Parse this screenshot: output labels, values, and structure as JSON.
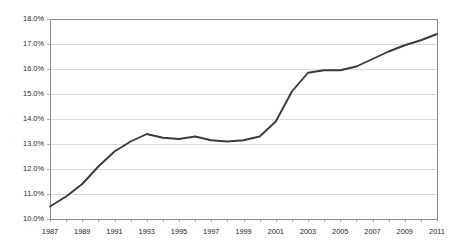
{
  "chart_data": {
    "type": "line",
    "title": "",
    "subtitle": "",
    "xlabel": "",
    "ylabel": "",
    "grid": true,
    "legend": false,
    "legend_position": "none",
    "line_color": "#3a3a3a",
    "gridline_color": "#c9c9c9",
    "axis_color": "#8a8a8a",
    "background_color": "#ffffff",
    "x": [
      1987,
      1988,
      1989,
      1990,
      1991,
      1992,
      1993,
      1994,
      1995,
      1996,
      1997,
      1998,
      1999,
      2000,
      2001,
      2002,
      2003,
      2004,
      2005,
      2006,
      2007,
      2008,
      2009,
      2010,
      2011
    ],
    "values": [
      10.5,
      10.9,
      11.4,
      12.1,
      12.7,
      13.1,
      13.4,
      13.25,
      13.2,
      13.3,
      13.15,
      13.1,
      13.15,
      13.3,
      13.9,
      15.1,
      15.85,
      15.95,
      15.95,
      16.1,
      16.4,
      16.7,
      16.95,
      17.15,
      17.4
    ],
    "xlim": [
      1987,
      2011
    ],
    "ylim": [
      10.0,
      18.0
    ],
    "ytick_values": [
      10.0,
      11.0,
      12.0,
      13.0,
      14.0,
      15.0,
      16.0,
      17.0,
      18.0
    ],
    "ytick_labels": [
      "10.0%",
      "11.0%",
      "12.0%",
      "13.0%",
      "14.0%",
      "15.0%",
      "16.0%",
      "17.0%",
      "18.0%"
    ],
    "xtick_values": [
      1987,
      1989,
      1991,
      1993,
      1995,
      1997,
      1999,
      2001,
      2003,
      2005,
      2007,
      2009,
      2011
    ],
    "xtick_labels": [
      "1987",
      "1989",
      "1991",
      "1993",
      "1995",
      "1997",
      "1999",
      "2001",
      "2003",
      "2005",
      "2007",
      "2009",
      "2011"
    ],
    "xminor_values": [
      1988,
      1990,
      1992,
      1994,
      1996,
      1998,
      2000,
      2002,
      2004,
      2006,
      2008,
      2010
    ],
    "series": [
      {
        "name": "series-1",
        "values": [
          10.5,
          10.9,
          11.4,
          12.1,
          12.7,
          13.1,
          13.4,
          13.25,
          13.2,
          13.3,
          13.15,
          13.1,
          13.15,
          13.3,
          13.9,
          15.1,
          15.85,
          15.95,
          15.95,
          16.1,
          16.4,
          16.7,
          16.95,
          17.15,
          17.4
        ]
      }
    ]
  },
  "plot": {
    "left": 50,
    "right": 437,
    "top": 19,
    "bottom": 219
  }
}
